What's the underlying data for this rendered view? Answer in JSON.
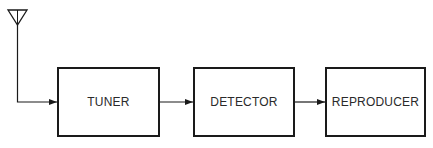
{
  "diagram": {
    "type": "block-diagram",
    "title": "",
    "blocks": [
      {
        "id": "tuner",
        "label": "TUNER"
      },
      {
        "id": "detector",
        "label": "DETECTOR"
      },
      {
        "id": "reproducer",
        "label": "REPRODUCER"
      }
    ],
    "input": {
      "icon": "antenna-icon"
    },
    "connections": [
      {
        "from": "antenna",
        "to": "tuner"
      },
      {
        "from": "tuner",
        "to": "detector"
      },
      {
        "from": "detector",
        "to": "reproducer"
      }
    ],
    "colors": {
      "line": "#1a1a1a",
      "text": "#2a2a2a",
      "background": "#ffffff"
    }
  }
}
